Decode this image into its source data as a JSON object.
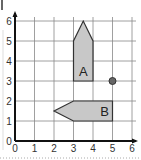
{
  "grid": {
    "x_ticks": [
      "0",
      "1",
      "2",
      "3",
      "4",
      "5",
      "6"
    ],
    "y_ticks": [
      "0",
      "1",
      "2",
      "3",
      "4",
      "5",
      "6"
    ],
    "x_range": [
      0,
      6
    ],
    "y_range": [
      0,
      6
    ]
  },
  "shapes": [
    {
      "label": "A",
      "vertices": [
        [
          3,
          3
        ],
        [
          4,
          3
        ],
        [
          4,
          5
        ],
        [
          3.5,
          6
        ],
        [
          3,
          5
        ]
      ],
      "fill": "#c8c8c8"
    },
    {
      "label": "B",
      "vertices": [
        [
          5,
          1
        ],
        [
          5,
          2
        ],
        [
          3,
          2
        ],
        [
          2,
          1.5
        ],
        [
          3,
          1
        ]
      ],
      "fill": "#c8c8c8"
    }
  ],
  "point": {
    "x": 5,
    "y": 3,
    "color": "#666666"
  },
  "colors": {
    "grid_line": "#888888",
    "axis": "#111111",
    "shape_fill": "#c8c8c8",
    "shape_stroke": "#333333"
  }
}
